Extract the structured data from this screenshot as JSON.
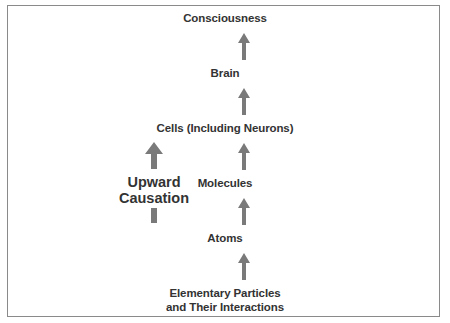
{
  "diagram": {
    "type": "hierarchy-flow",
    "levels": [
      {
        "label": "Consciousness"
      },
      {
        "label": "Brain"
      },
      {
        "label": "Cells (Including Neurons)"
      },
      {
        "label": "Molecules"
      },
      {
        "label": "Atoms"
      },
      {
        "label_line1": "Elementary Particles",
        "label_line2": "and Their Interactions"
      }
    ],
    "side_label": {
      "line1": "Upward",
      "line2": "Causation"
    },
    "colors": {
      "arrow": "#7a7a7a",
      "border": "#8a8a8a",
      "text": "#333333",
      "background": "#ffffff"
    }
  }
}
